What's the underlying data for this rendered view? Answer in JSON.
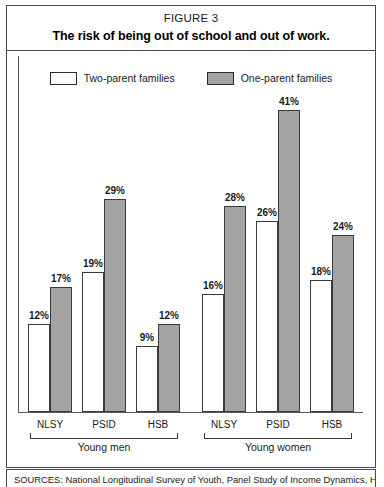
{
  "figure": {
    "number": "FIGURE 3",
    "title": "The risk of being out of school and out of work."
  },
  "legend": {
    "items": [
      {
        "label": "Two-parent families",
        "swatch": "white-outline-swatch",
        "color": "#ffffff"
      },
      {
        "label": "One-parent families",
        "swatch": "gray-filled-swatch",
        "color": "#a3a3a3"
      }
    ]
  },
  "groups": [
    {
      "label": "Young men"
    },
    {
      "label": "Young women"
    }
  ],
  "sources": {
    "label": "SOURCES:",
    "text": "SOURCES: National Longitudinal Survey of Youth, Panel Study of Income Dynamics, High"
  },
  "chart_data": {
    "type": "bar",
    "title": "The risk of being out of school and out of work.",
    "subtitle": "FIGURE 3",
    "xlabel": "",
    "ylabel": "",
    "ylim": [
      0,
      45
    ],
    "grid": false,
    "legend_position": "top-center",
    "value_format": "percent",
    "groups": [
      "Young men",
      "Young women"
    ],
    "categories": [
      "NLSY",
      "PSID",
      "HSB",
      "NLSY",
      "PSID",
      "HSB"
    ],
    "series": [
      {
        "name": "Two-parent families",
        "color": "#ffffff",
        "values": [
          12,
          19,
          9,
          16,
          26,
          18
        ],
        "labels": [
          "12%",
          "19%",
          "9%",
          "16%",
          "26%",
          "18%"
        ]
      },
      {
        "name": "One-parent families",
        "color": "#a3a3a3",
        "values": [
          17,
          29,
          12,
          28,
          41,
          24
        ],
        "labels": [
          "17%",
          "29%",
          "12%",
          "28%",
          "41%",
          "24%"
        ]
      }
    ],
    "bars": [
      {
        "group": "Young men",
        "category": "NLSY",
        "series": "Two-parent families",
        "value": 12,
        "label": "12%"
      },
      {
        "group": "Young men",
        "category": "NLSY",
        "series": "One-parent families",
        "value": 17,
        "label": "17%"
      },
      {
        "group": "Young men",
        "category": "PSID",
        "series": "Two-parent families",
        "value": 19,
        "label": "19%"
      },
      {
        "group": "Young men",
        "category": "PSID",
        "series": "One-parent families",
        "value": 29,
        "label": "29%"
      },
      {
        "group": "Young men",
        "category": "HSB",
        "series": "Two-parent families",
        "value": 9,
        "label": "9%"
      },
      {
        "group": "Young men",
        "category": "HSB",
        "series": "One-parent families",
        "value": 12,
        "label": "12%"
      },
      {
        "group": "Young women",
        "category": "NLSY",
        "series": "Two-parent families",
        "value": 16,
        "label": "16%"
      },
      {
        "group": "Young women",
        "category": "NLSY",
        "series": "One-parent families",
        "value": 28,
        "label": "28%"
      },
      {
        "group": "Young women",
        "category": "PSID",
        "series": "Two-parent families",
        "value": 26,
        "label": "26%"
      },
      {
        "group": "Young women",
        "category": "PSID",
        "series": "One-parent families",
        "value": 41,
        "label": "41%"
      },
      {
        "group": "Young women",
        "category": "HSB",
        "series": "Two-parent families",
        "value": 18,
        "label": "18%"
      },
      {
        "group": "Young women",
        "category": "HSB",
        "series": "One-parent families",
        "value": 24,
        "label": "24%"
      }
    ]
  }
}
